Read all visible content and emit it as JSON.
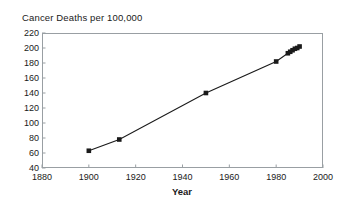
{
  "chart_data": {
    "type": "line",
    "title": "Cancer Deaths per 100,000",
    "xlabel": "Year",
    "ylabel": "",
    "xlim": [
      1880,
      2000
    ],
    "ylim": [
      40,
      220
    ],
    "xticks": [
      1880,
      1900,
      1920,
      1940,
      1960,
      1980,
      2000
    ],
    "yticks": [
      40,
      60,
      80,
      100,
      120,
      140,
      160,
      180,
      200,
      220
    ],
    "grid": false,
    "legend": null,
    "marker": "square",
    "marker_color": "#1a1a1a",
    "line_color": "#1a1a1a",
    "x": [
      1900,
      1913,
      1950,
      1980,
      1985,
      1986,
      1987,
      1988,
      1989,
      1990
    ],
    "y": [
      63,
      78,
      140,
      182,
      193,
      195,
      197,
      199,
      200,
      202
    ],
    "series": [
      {
        "name": "Cancer Deaths per 100,000",
        "points": [
          {
            "x": 1900,
            "y": 63
          },
          {
            "x": 1913,
            "y": 78
          },
          {
            "x": 1950,
            "y": 140
          },
          {
            "x": 1980,
            "y": 182
          },
          {
            "x": 1985,
            "y": 193
          },
          {
            "x": 1986,
            "y": 195
          },
          {
            "x": 1987,
            "y": 197
          },
          {
            "x": 1988,
            "y": 199
          },
          {
            "x": 1989,
            "y": 200
          },
          {
            "x": 1990,
            "y": 202
          }
        ]
      }
    ]
  },
  "axes": {
    "y_tick_labels": [
      "220",
      "200",
      "180",
      "160",
      "140",
      "120",
      "100",
      "80",
      "60",
      "40"
    ],
    "x_tick_labels": [
      "1880",
      "1900",
      "1920",
      "1940",
      "1960",
      "1980",
      "2000"
    ],
    "x_title": "Year"
  },
  "colors": {
    "frame": "#999fa3",
    "data": "#1a1a1a",
    "background": "#ffffff"
  }
}
